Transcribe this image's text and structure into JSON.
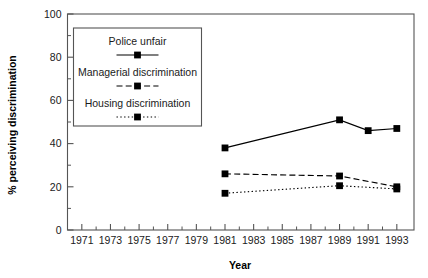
{
  "chart_data": {
    "type": "line",
    "title": "",
    "xlabel": "Year",
    "ylabel": "% perceiving discrimination",
    "xlim": [
      1970,
      1994.2
    ],
    "ylim": [
      0,
      100
    ],
    "grid": false,
    "legend_position": "upper-left-inside",
    "x_tick_labels": [
      "1971",
      "1973",
      "1975",
      "1977",
      "1979",
      "1981",
      "1983",
      "1985",
      "1987",
      "1989",
      "1991",
      "1993"
    ],
    "x_ticks": [
      1971,
      1973,
      1975,
      1977,
      1979,
      1981,
      1983,
      1985,
      1987,
      1989,
      1991,
      1993
    ],
    "x_minor_ticks": [
      1972,
      1974,
      1976,
      1978,
      1980,
      1982,
      1984,
      1986,
      1988,
      1990,
      1992
    ],
    "y_tick_labels": [
      "0",
      "20",
      "40",
      "60",
      "80",
      "100"
    ],
    "y_ticks": [
      0,
      20,
      40,
      60,
      80,
      100
    ],
    "y_minor_ticks": [
      10,
      30,
      50,
      70,
      90
    ],
    "x": [
      1981,
      1989,
      1991,
      1993
    ],
    "series": [
      {
        "name": "Police unfair",
        "style": "solid",
        "marker": "square",
        "values": [
          38,
          51,
          46,
          47
        ]
      },
      {
        "name": "Managerial discrimination",
        "style": "dashed",
        "marker": "square",
        "values": [
          26,
          25,
          null,
          20
        ]
      },
      {
        "name": "Housing discrimination",
        "style": "dotted",
        "marker": "square",
        "values": [
          17,
          20.5,
          null,
          19
        ]
      }
    ]
  },
  "legend": {
    "entries": [
      {
        "label": "Police unfair",
        "style": "solid"
      },
      {
        "label": "Managerial discrimination",
        "style": "dashed"
      },
      {
        "label": "Housing discrimination",
        "style": "dotted"
      }
    ]
  },
  "colors": {
    "ink": "#000000",
    "text": "#1a1a1a",
    "frame": "#555555",
    "background": "#ffffff"
  }
}
